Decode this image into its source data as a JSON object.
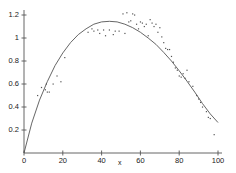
{
  "chart_data": {
    "type": "scatter",
    "title": "",
    "subtitle": "",
    "xlabel": "x",
    "ylabel": "",
    "xlim": [
      0,
      100
    ],
    "ylim": [
      0,
      1.28
    ],
    "grid": false,
    "legend": false,
    "xticks": [
      0,
      20,
      40,
      60,
      80,
      100
    ],
    "xtick_labels": [
      "0",
      "20",
      "40",
      "60",
      "80",
      "100"
    ],
    "yticks": [
      0.2,
      0.4,
      0.6,
      0.8,
      1,
      1.2
    ],
    "ytick_labels": [
      "0.2",
      "0.4",
      "0.6",
      "0.8",
      "1",
      "1.2"
    ],
    "axis_color": "#555555",
    "curve_color": "#555555",
    "point_color": "#555555",
    "series": [
      {
        "name": "observations",
        "type": "scatter",
        "marker": "dot",
        "points": [
          [
            7,
            0.5
          ],
          [
            9,
            0.57
          ],
          [
            11,
            0.55
          ],
          [
            11.5,
            0.6
          ],
          [
            12,
            0.53
          ],
          [
            13,
            0.53
          ],
          [
            15,
            0.6
          ],
          [
            17,
            0.67
          ],
          [
            19,
            0.62
          ],
          [
            21,
            0.83
          ],
          [
            33,
            1.05
          ],
          [
            35,
            1.08
          ],
          [
            36,
            1.06
          ],
          [
            38,
            1.07
          ],
          [
            39,
            1.04
          ],
          [
            41,
            1.07
          ],
          [
            42,
            1.02
          ],
          [
            44,
            1.07
          ],
          [
            46,
            1.03
          ],
          [
            47,
            1.06
          ],
          [
            49,
            1.06
          ],
          [
            51,
            1.21
          ],
          [
            52,
            1.04
          ],
          [
            53,
            1.22
          ],
          [
            54,
            1.14
          ],
          [
            55,
            1.15
          ],
          [
            56,
            1.21
          ],
          [
            57,
            1.2
          ],
          [
            58,
            1.12
          ],
          [
            59,
            1.08
          ],
          [
            60,
            1.14
          ],
          [
            61,
            1.13
          ],
          [
            62,
            1.1
          ],
          [
            63,
            1.12
          ],
          [
            64,
            1.02
          ],
          [
            65,
            1.16
          ],
          [
            66,
            1.13
          ],
          [
            67,
            1.1
          ],
          [
            68,
            1.12
          ],
          [
            69,
            1.05
          ],
          [
            70,
            1.09
          ],
          [
            71,
            1.01
          ],
          [
            72,
            0.96
          ],
          [
            73,
            0.91
          ],
          [
            74,
            0.9
          ],
          [
            75,
            0.9
          ],
          [
            76,
            0.84
          ],
          [
            77,
            0.79
          ],
          [
            78,
            0.74
          ],
          [
            79,
            0.72
          ],
          [
            80,
            0.67
          ],
          [
            81,
            0.66
          ],
          [
            82,
            0.69
          ],
          [
            83,
            0.65
          ],
          [
            84,
            0.72
          ],
          [
            85,
            0.62
          ],
          [
            87,
            0.58
          ],
          [
            89,
            0.5
          ],
          [
            90,
            0.47
          ],
          [
            91,
            0.44
          ],
          [
            92,
            0.4
          ],
          [
            94,
            0.36
          ],
          [
            95,
            0.31
          ],
          [
            96,
            0.3
          ],
          [
            98,
            0.16
          ]
        ]
      },
      {
        "name": "fitted-curve",
        "type": "line",
        "points": [
          [
            0,
            0.0
          ],
          [
            4,
            0.26
          ],
          [
            8,
            0.46
          ],
          [
            12,
            0.62
          ],
          [
            16,
            0.76
          ],
          [
            20,
            0.87
          ],
          [
            24,
            0.96
          ],
          [
            28,
            1.03
          ],
          [
            32,
            1.08
          ],
          [
            36,
            1.12
          ],
          [
            40,
            1.14
          ],
          [
            44,
            1.145
          ],
          [
            48,
            1.14
          ],
          [
            52,
            1.12
          ],
          [
            56,
            1.09
          ],
          [
            60,
            1.05
          ],
          [
            64,
            1.0
          ],
          [
            68,
            0.945
          ],
          [
            72,
            0.875
          ],
          [
            76,
            0.8
          ],
          [
            80,
            0.715
          ],
          [
            84,
            0.625
          ],
          [
            88,
            0.53
          ],
          [
            92,
            0.43
          ],
          [
            96,
            0.34
          ],
          [
            100,
            0.265
          ]
        ]
      }
    ]
  },
  "axes": {
    "x_axis_title": "x"
  }
}
